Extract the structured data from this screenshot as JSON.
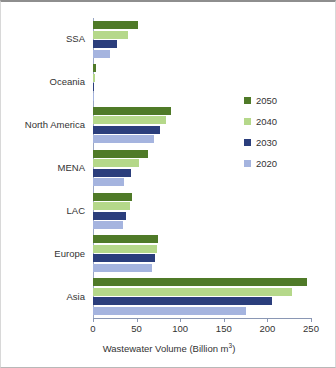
{
  "chart_data": {
    "type": "bar",
    "orientation": "horizontal",
    "title": "",
    "subtitle": "",
    "xlabel": "Wastewater Volume (Billion m³)",
    "ylabel": "",
    "categories": [
      "SSA",
      "Oceania",
      "North America",
      "MENA",
      "LAC",
      "Europe",
      "Asia"
    ],
    "series": [
      {
        "name": "2050",
        "color": "#4F7A28",
        "values": [
          52,
          3,
          89,
          63,
          45,
          75,
          245
        ]
      },
      {
        "name": "2040",
        "color": "#B5D88A",
        "values": [
          40,
          2,
          84,
          53,
          42,
          73,
          228
        ]
      },
      {
        "name": "2030",
        "color": "#2B3E7C",
        "values": [
          28,
          1.5,
          77,
          44,
          38,
          71,
          205
        ]
      },
      {
        "name": "2020",
        "color": "#A5B4DF",
        "values": [
          20,
          1.5,
          70,
          36,
          34,
          68,
          176
        ]
      }
    ],
    "xlim": [
      0,
      250
    ],
    "xticks": [
      0,
      50,
      100,
      150,
      200,
      250
    ],
    "xtick_labels": [
      "0",
      "50",
      "100",
      "150",
      "200",
      "250"
    ],
    "grid": false,
    "legend": {
      "position": "right",
      "entries": [
        "2050",
        "2040",
        "2030",
        "2020"
      ]
    }
  }
}
